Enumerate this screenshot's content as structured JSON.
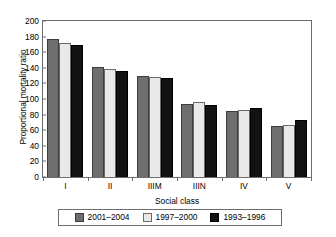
{
  "chart_data": {
    "type": "bar",
    "title": "",
    "xlabel": "Social class",
    "ylabel": "Proportional mortality ratio",
    "categories": [
      "I",
      "II",
      "IIIM",
      "IIIN",
      "IV",
      "V"
    ],
    "ylim": [
      0,
      200
    ],
    "yticks": [
      0,
      20,
      40,
      60,
      80,
      100,
      120,
      140,
      160,
      180,
      200
    ],
    "ytick_labels": [
      "0",
      "20",
      "40",
      "60",
      "80",
      "100",
      "120",
      "140",
      "160",
      "180",
      "200"
    ],
    "grid": false,
    "legend_position": "bottom",
    "series": [
      {
        "name": "2001–2004",
        "color": "#6e6e6e",
        "values": [
          177,
          141,
          129,
          94,
          84,
          65
        ]
      },
      {
        "name": "1997–2000",
        "color": "#e9e9e9",
        "values": [
          172,
          138,
          128,
          96,
          86,
          67
        ]
      },
      {
        "name": "1993–1996",
        "color": "#121212",
        "values": [
          169,
          136,
          127,
          92,
          89,
          73
        ]
      }
    ]
  }
}
